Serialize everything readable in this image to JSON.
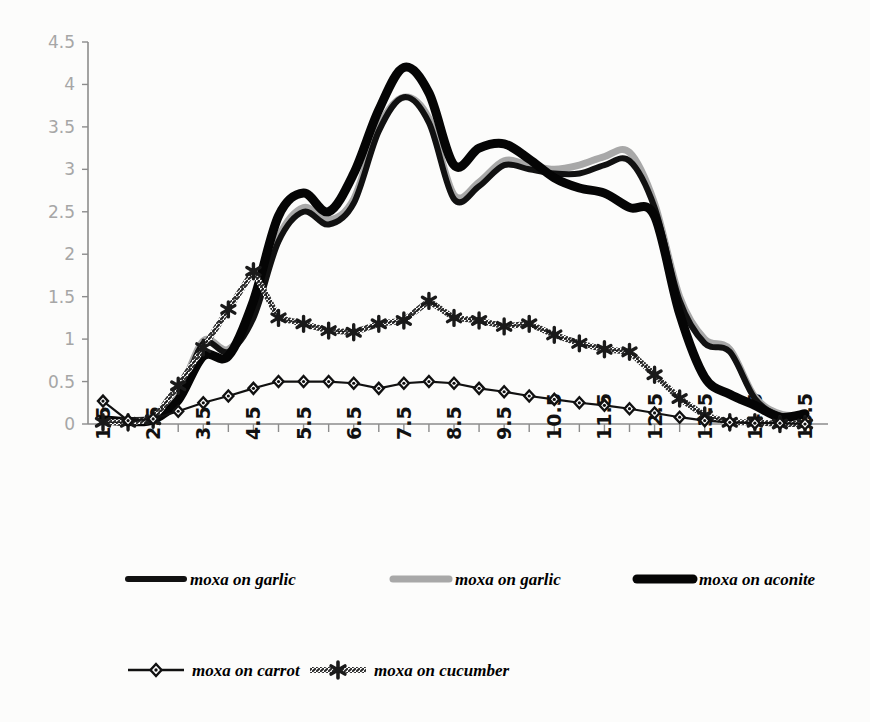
{
  "chart_data": {
    "type": "line",
    "title": "",
    "subtitle": "",
    "xlabel": "",
    "ylabel": "",
    "xlim": [
      1.5,
      15.5
    ],
    "ylim": [
      0,
      4.5
    ],
    "grid": false,
    "legend_position": "bottom",
    "y_ticks": [
      "0",
      "0.5",
      "1",
      "1.5",
      "2",
      "2.5",
      "3",
      "3.5",
      "4",
      "4.5"
    ],
    "y_tick_values": [
      0,
      0.5,
      1,
      1.5,
      2,
      2.5,
      3,
      3.5,
      4,
      4.5
    ],
    "x_ticks": [
      "1.5",
      "2.5",
      "3.5",
      "4.5",
      "5.5",
      "6.5",
      "7.5",
      "8.5",
      "9.5",
      "10.5",
      "11.5",
      "12.5",
      "13.5",
      "14.5",
      "15.5"
    ],
    "x": [
      1.5,
      2.0,
      2.5,
      3.0,
      3.5,
      4.0,
      4.5,
      5.0,
      5.5,
      6.0,
      6.5,
      7.0,
      7.5,
      8.0,
      8.5,
      9.0,
      9.5,
      10.0,
      10.5,
      11.0,
      11.5,
      12.0,
      12.5,
      13.0,
      13.5,
      14.0,
      14.5,
      15.0,
      15.5
    ],
    "series": [
      {
        "name": "moxa on garlic",
        "style": "thin-black-line",
        "color": "#111111",
        "width": 6,
        "marker": "none",
        "values": [
          0.05,
          0.04,
          0.06,
          0.3,
          0.95,
          0.85,
          1.25,
          2.15,
          2.5,
          2.35,
          2.6,
          3.45,
          3.85,
          3.55,
          2.65,
          2.8,
          3.05,
          3.0,
          2.95,
          2.95,
          3.05,
          3.1,
          2.55,
          1.45,
          0.95,
          0.85,
          0.3,
          0.1,
          0.1
        ]
      },
      {
        "name": "moxa on garlic",
        "style": "gray-line",
        "color": "#a8a8a8",
        "width": 7,
        "marker": "none",
        "values": [
          0.05,
          0.04,
          0.08,
          0.35,
          0.98,
          0.88,
          1.3,
          2.2,
          2.55,
          2.4,
          2.65,
          3.5,
          3.85,
          3.6,
          2.7,
          2.85,
          3.1,
          3.05,
          3.0,
          3.05,
          3.15,
          3.2,
          2.6,
          1.5,
          1.0,
          0.88,
          0.32,
          0.12,
          0.1
        ]
      },
      {
        "name": "moxa on aconite",
        "style": "thick-black-line",
        "color": "#050505",
        "width": 9,
        "marker": "none",
        "values": [
          0.05,
          0.03,
          0.05,
          0.28,
          0.8,
          0.8,
          1.45,
          2.45,
          2.72,
          2.5,
          2.95,
          3.7,
          4.2,
          3.9,
          3.05,
          3.25,
          3.3,
          3.12,
          2.9,
          2.78,
          2.72,
          2.55,
          2.45,
          1.3,
          0.55,
          0.35,
          0.22,
          0.08,
          0.12
        ]
      },
      {
        "name": "moxa on carrot",
        "style": "line-with-diamond-markers",
        "color": "#111111",
        "width": 2.2,
        "marker": "diamond",
        "values": [
          0.27,
          0.04,
          0.06,
          0.15,
          0.25,
          0.33,
          0.42,
          0.5,
          0.5,
          0.5,
          0.48,
          0.42,
          0.48,
          0.5,
          0.48,
          0.42,
          0.38,
          0.33,
          0.29,
          0.25,
          0.22,
          0.18,
          0.13,
          0.08,
          0.04,
          0.02,
          0.01,
          0.01,
          0.0
        ]
      },
      {
        "name": "moxa on cucumber",
        "style": "hatched-line-with-star-markers",
        "color": "#1a1a1a",
        "width": 3.0,
        "marker": "star",
        "values": [
          0.02,
          0.02,
          0.05,
          0.45,
          0.9,
          1.35,
          1.8,
          1.25,
          1.18,
          1.1,
          1.08,
          1.18,
          1.22,
          1.45,
          1.25,
          1.22,
          1.15,
          1.18,
          1.05,
          0.95,
          0.88,
          0.85,
          0.58,
          0.3,
          0.1,
          0.02,
          0.02,
          0.0,
          0.0
        ]
      }
    ]
  },
  "legend": {
    "row1": [
      {
        "label": "moxa on garlic",
        "swatch": "solid-black-thin"
      },
      {
        "label": "moxa on garlic",
        "swatch": "solid-gray"
      },
      {
        "label": "moxa on aconite",
        "swatch": "solid-black-thick"
      }
    ],
    "row2": [
      {
        "label": "moxa on carrot",
        "swatch": "diamond-marker-line"
      },
      {
        "label": "moxa on cucumber",
        "swatch": "star-marker-line"
      }
    ]
  }
}
